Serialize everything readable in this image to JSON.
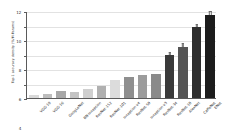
{
  "chart_data": {
    "type": "bar",
    "title": "",
    "subtitle": "",
    "xlabel": "",
    "ylabel": "Top-1 accuracy density (%/M-Params)",
    "ylim": [
      0,
      12
    ],
    "yticks": [
      0,
      2,
      4,
      6,
      8,
      10,
      12
    ],
    "ytick_labels": [
      "0",
      "2",
      "4",
      "6",
      "8",
      "10",
      "12"
    ],
    "grid": true,
    "legend": null,
    "has_error_bars": true,
    "categories": [
      "VGG-19",
      "VGG-16",
      "GoogLeNet",
      "BN-Inception",
      "ResNet-152",
      "ResNet-101",
      "Inception-v4",
      "ResNet-50",
      "Inception-v3",
      "ResNet-34",
      "ResNet-18",
      "AlexNet",
      "CaffeNet",
      "ENet"
    ],
    "values": [
      0.45,
      0.55,
      0.9,
      0.85,
      1.2,
      1.65,
      2.45,
      2.9,
      3.2,
      3.35,
      5.9,
      7.1,
      9.75,
      11.5
    ],
    "bar_colors": [
      "#d9d9d9",
      "#bdbdbd",
      "#a8a8a8",
      "#c4c4c4",
      "#cfcfcf",
      "#b0b0b0",
      "#dcdcdc",
      "#8f8f8f",
      "#9c9c9c",
      "#8a8a8a",
      "#3a3a3a",
      "#555555",
      "#2e2e2e",
      "#1c1c1c"
    ]
  }
}
